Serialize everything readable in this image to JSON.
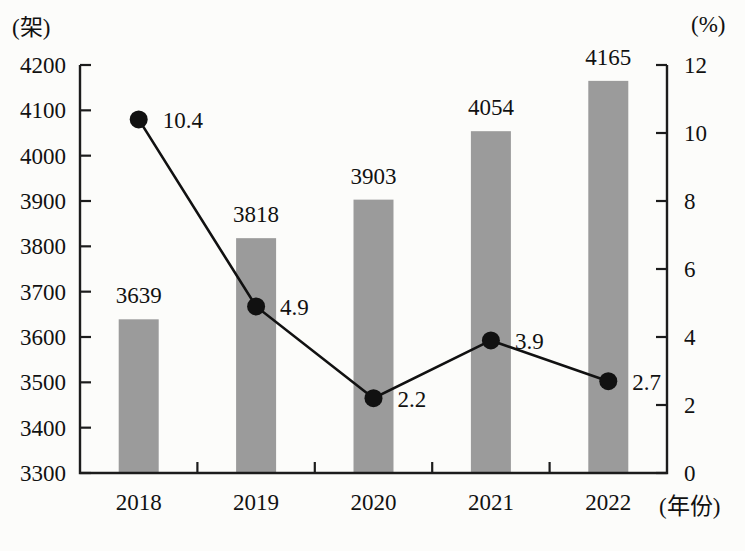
{
  "chart_data": {
    "type": "combo",
    "categories": [
      "2018",
      "2019",
      "2020",
      "2021",
      "2022"
    ],
    "series": [
      {
        "name": "bar-series",
        "type": "bar",
        "axis": "left",
        "values": [
          3639,
          3818,
          3903,
          4054,
          4165
        ]
      },
      {
        "name": "line-series",
        "type": "line",
        "axis": "right",
        "values": [
          10.4,
          4.9,
          2.2,
          3.9,
          2.7
        ]
      }
    ],
    "bar_value_labels": [
      "3639",
      "3818",
      "3903",
      "4054",
      "4165"
    ],
    "point_value_labels": [
      "10.4",
      "4.9",
      "2.2",
      "3.9",
      "2.7"
    ],
    "left_axis": {
      "label": "(架)",
      "min": 3300,
      "max": 4200,
      "tick_step": 100,
      "ticks": [
        3300,
        3400,
        3500,
        3600,
        3700,
        3800,
        3900,
        4000,
        4100,
        4200
      ]
    },
    "right_axis": {
      "label": "(%)",
      "min": 0,
      "max": 12,
      "tick_step": 2,
      "ticks": [
        0,
        2,
        4,
        6,
        8,
        10,
        12
      ]
    },
    "x_axis": {
      "label": "(年份)"
    },
    "grid": false,
    "legend": "none",
    "data_labels": true
  },
  "colors": {
    "bar": "#9b9b9b",
    "line": "#111111",
    "marker": "#111111",
    "axis": "#1c1c1c",
    "text": "#111111",
    "background": "#fcfcfa"
  }
}
